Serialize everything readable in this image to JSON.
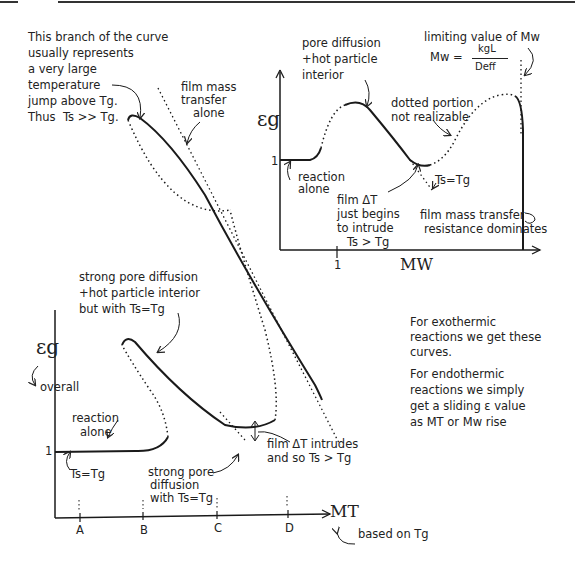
{
  "header_rule": true,
  "top_left_note": {
    "lines": [
      "This branch of the curve",
      "usually represents",
      "a very large",
      "temperature",
      "jump above Tg.",
      "Thus  Ts >> Tg."
    ]
  },
  "film_mass_transfer_alone": {
    "lines": [
      "film mass",
      "transfer",
      "alone"
    ]
  },
  "inset_chart": {
    "y_label": "εg",
    "y_tick": "1",
    "x_label": "MW",
    "x_tick": "1",
    "labels": {
      "pore_diffusion": [
        "pore diffusion",
        "+hot particle",
        "interior"
      ],
      "limiting_value": "limiting value of Mw",
      "formula_lhs": "Mw =",
      "formula_num": "kgL",
      "formula_den": "Deff",
      "dotted_portion": [
        "dotted portion",
        "not realizable"
      ],
      "reaction_alone": [
        "reaction",
        "alone"
      ],
      "ts_eq_tg": "Ts=Tg",
      "film_dt": [
        "film ΔT",
        "just begins",
        "to intrude",
        "Ts > Tg"
      ],
      "film_resistance": [
        "film mass transfer",
        "resistance dominates"
      ]
    }
  },
  "main_chart": {
    "y_label": "εg",
    "y_sub_label": "overall",
    "y_tick": "1",
    "x_label": "MT",
    "x_note": "based on Tg",
    "x_ticks": [
      "A",
      "B",
      "C",
      "D"
    ],
    "labels": {
      "strong_pore_hot": [
        "strong pore diffusion",
        "+hot particle interior",
        "but with Ts=Tg"
      ],
      "reaction_alone": [
        "reaction",
        "alone"
      ],
      "ts_eq_tg": "Ts=Tg",
      "strong_pore": [
        "strong pore",
        "diffusion",
        "with Ts=Tg"
      ],
      "film_dt_intrudes": [
        "film ΔT intrudes",
        "and so Ts > Tg"
      ]
    }
  },
  "side_notes": {
    "exothermic": [
      "For exothermic",
      "reactions we get these",
      "curves."
    ],
    "endothermic": [
      "For endothermic",
      "reactions we simply",
      "get a sliding ε value",
      "as MT or Mw rise"
    ]
  }
}
